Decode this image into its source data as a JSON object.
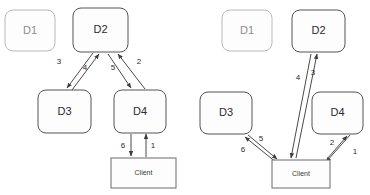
{
  "figure": {
    "background_color": "#ffffff",
    "stroke_color": "#4a4a4a",
    "faint_stroke_color": "#b9b9b9",
    "panels": [
      {
        "id": "left-panel",
        "nodes": [
          {
            "id": "d1",
            "label": "D1",
            "x": 5,
            "y": 10,
            "w": 50,
            "h": 41,
            "style": "faint",
            "shape": "rounded"
          },
          {
            "id": "d2",
            "label": "D2",
            "x": 73,
            "y": 8,
            "w": 55,
            "h": 44,
            "style": "solid",
            "shape": "rounded"
          },
          {
            "id": "d3",
            "label": "D3",
            "x": 38,
            "y": 90,
            "w": 53,
            "h": 43,
            "style": "solid",
            "shape": "rounded"
          },
          {
            "id": "d4",
            "label": "D4",
            "x": 114,
            "y": 90,
            "w": 52,
            "h": 43,
            "style": "solid",
            "shape": "rounded"
          },
          {
            "id": "client",
            "label": "Client",
            "x": 111,
            "y": 158,
            "w": 65,
            "h": 30,
            "style": "solid",
            "shape": "rect"
          }
        ],
        "edges": [
          {
            "id": "e3",
            "label": "3",
            "from": "d2",
            "to": "d3",
            "label_x": 59,
            "label_y": 62
          },
          {
            "id": "e4",
            "label": "4",
            "from": "d3",
            "to": "d2",
            "label_x": 85,
            "label_y": 68
          },
          {
            "id": "e5",
            "label": "5",
            "from": "d2",
            "to": "d4",
            "label_x": 113,
            "label_y": 68
          },
          {
            "id": "e2",
            "label": "2",
            "from": "d4",
            "to": "d2",
            "label_x": 139,
            "label_y": 62
          },
          {
            "id": "e6",
            "label": "6",
            "from": "d4",
            "to": "client",
            "label_x": 123,
            "label_y": 146
          },
          {
            "id": "e1",
            "label": "1",
            "from": "client",
            "to": "d4",
            "label_x": 153,
            "label_y": 146
          }
        ]
      },
      {
        "id": "right-panel",
        "nodes": [
          {
            "id": "d1",
            "label": "D1",
            "x": 222,
            "y": 10,
            "w": 50,
            "h": 41,
            "style": "faint",
            "shape": "rounded"
          },
          {
            "id": "d2",
            "label": "D2",
            "x": 292,
            "y": 10,
            "w": 53,
            "h": 42,
            "style": "solid",
            "shape": "rounded"
          },
          {
            "id": "d3",
            "label": "D3",
            "x": 200,
            "y": 92,
            "w": 52,
            "h": 42,
            "style": "solid",
            "shape": "rounded"
          },
          {
            "id": "d4",
            "label": "D4",
            "x": 312,
            "y": 92,
            "w": 51,
            "h": 42,
            "style": "solid",
            "shape": "rounded"
          },
          {
            "id": "client",
            "label": "Client",
            "x": 272,
            "y": 160,
            "w": 58,
            "h": 28,
            "style": "solid",
            "shape": "rect"
          }
        ],
        "edges": [
          {
            "id": "e3",
            "label": "3",
            "from": "client",
            "to": "d2",
            "label_x": 313,
            "label_y": 73
          },
          {
            "id": "e4",
            "label": "4",
            "from": "d2",
            "to": "client",
            "label_x": 298,
            "label_y": 78
          },
          {
            "id": "e5",
            "label": "5",
            "from": "d3",
            "to": "client",
            "label_x": 261,
            "label_y": 139
          },
          {
            "id": "e6",
            "label": "6",
            "from": "client",
            "to": "d3",
            "label_x": 243,
            "label_y": 150
          },
          {
            "id": "e2",
            "label": "2",
            "from": "client",
            "to": "d4",
            "label_x": 332,
            "label_y": 143
          },
          {
            "id": "e1",
            "label": "1",
            "from": "d4",
            "to": "client",
            "label_x": 355,
            "label_y": 152
          }
        ]
      }
    ]
  }
}
